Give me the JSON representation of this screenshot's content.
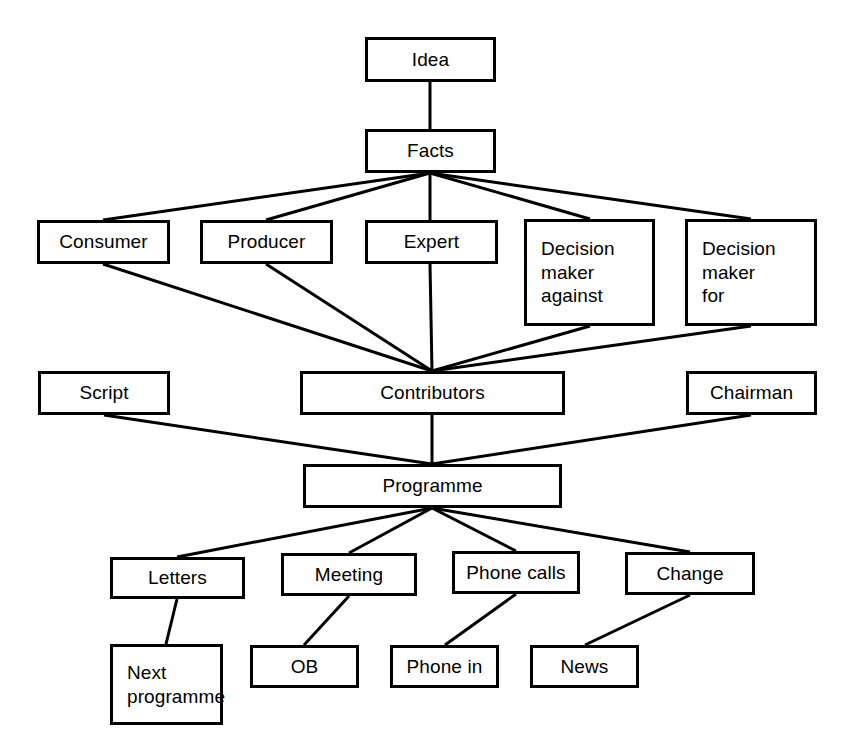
{
  "diagram": {
    "type": "flow-tree",
    "stroke_color": "#000000",
    "fill_color": "#ffffff",
    "background_color": "#ffffff",
    "stroke_width": 3,
    "nodes": [
      {
        "id": "idea",
        "label": "Idea",
        "x": 365,
        "y": 37,
        "w": 131,
        "h": 45,
        "align": "center"
      },
      {
        "id": "facts",
        "label": "Facts",
        "x": 365,
        "y": 129,
        "w": 131,
        "h": 44,
        "align": "center"
      },
      {
        "id": "consumer",
        "label": "Consumer",
        "x": 37,
        "y": 220,
        "w": 133,
        "h": 44,
        "align": "center"
      },
      {
        "id": "producer",
        "label": "Producer",
        "x": 200,
        "y": 220,
        "w": 133,
        "h": 44,
        "align": "center"
      },
      {
        "id": "expert",
        "label": "Expert",
        "x": 365,
        "y": 220,
        "w": 133,
        "h": 44,
        "align": "center"
      },
      {
        "id": "decision-against",
        "label": "Decision\nmaker\nagainst",
        "x": 524,
        "y": 219,
        "w": 131,
        "h": 107,
        "align": "left"
      },
      {
        "id": "decision-for",
        "label": "Decision\nmaker\nfor",
        "x": 685,
        "y": 219,
        "w": 132,
        "h": 107,
        "align": "left"
      },
      {
        "id": "script",
        "label": "Script",
        "x": 38,
        "y": 371,
        "w": 132,
        "h": 44,
        "align": "center"
      },
      {
        "id": "contributors",
        "label": "Contributors",
        "x": 300,
        "y": 371,
        "w": 265,
        "h": 44,
        "align": "center"
      },
      {
        "id": "chairman",
        "label": "Chairman",
        "x": 686,
        "y": 371,
        "w": 131,
        "h": 44,
        "align": "center"
      },
      {
        "id": "programme",
        "label": "Programme",
        "x": 303,
        "y": 464,
        "w": 259,
        "h": 44,
        "align": "center"
      },
      {
        "id": "letters",
        "label": "Letters",
        "x": 110,
        "y": 557,
        "w": 135,
        "h": 42,
        "align": "center"
      },
      {
        "id": "meeting",
        "label": "Meeting",
        "x": 281,
        "y": 553,
        "w": 136,
        "h": 43,
        "align": "center"
      },
      {
        "id": "phone-calls",
        "label": "Phone calls",
        "x": 452,
        "y": 551,
        "w": 128,
        "h": 43,
        "align": "center"
      },
      {
        "id": "change",
        "label": "Change",
        "x": 625,
        "y": 552,
        "w": 130,
        "h": 43,
        "align": "center"
      },
      {
        "id": "next-programme",
        "label": "Next\nprogramme",
        "x": 110,
        "y": 644,
        "w": 113,
        "h": 81,
        "align": "left"
      },
      {
        "id": "ob",
        "label": "OB",
        "x": 250,
        "y": 645,
        "w": 109,
        "h": 43,
        "align": "center"
      },
      {
        "id": "phone-in",
        "label": "Phone in",
        "x": 390,
        "y": 645,
        "w": 109,
        "h": 43,
        "align": "center"
      },
      {
        "id": "news",
        "label": "News",
        "x": 530,
        "y": 645,
        "w": 109,
        "h": 43,
        "align": "center"
      }
    ],
    "edges": [
      {
        "from": "idea",
        "to": "facts",
        "x1": 430,
        "y1": 82,
        "x2": 430,
        "y2": 129
      },
      {
        "from": "facts",
        "to": "consumer",
        "x1": 430,
        "y1": 173,
        "x2": 103,
        "y2": 220
      },
      {
        "from": "facts",
        "to": "producer",
        "x1": 430,
        "y1": 173,
        "x2": 266,
        "y2": 220
      },
      {
        "from": "facts",
        "to": "expert",
        "x1": 430,
        "y1": 173,
        "x2": 430,
        "y2": 220
      },
      {
        "from": "facts",
        "to": "decision-against",
        "x1": 430,
        "y1": 173,
        "x2": 590,
        "y2": 219
      },
      {
        "from": "facts",
        "to": "decision-for",
        "x1": 430,
        "y1": 173,
        "x2": 751,
        "y2": 219
      },
      {
        "from": "consumer",
        "to": "contributors",
        "x1": 103,
        "y1": 264,
        "x2": 432,
        "y2": 371
      },
      {
        "from": "producer",
        "to": "contributors",
        "x1": 266,
        "y1": 264,
        "x2": 432,
        "y2": 371
      },
      {
        "from": "expert",
        "to": "contributors",
        "x1": 430,
        "y1": 264,
        "x2": 432,
        "y2": 371
      },
      {
        "from": "decision-against",
        "to": "contributors",
        "x1": 590,
        "y1": 326,
        "x2": 432,
        "y2": 371
      },
      {
        "from": "decision-for",
        "to": "contributors",
        "x1": 751,
        "y1": 326,
        "x2": 432,
        "y2": 371
      },
      {
        "from": "script",
        "to": "programme",
        "x1": 104,
        "y1": 415,
        "x2": 432,
        "y2": 464
      },
      {
        "from": "contributors",
        "to": "programme",
        "x1": 432,
        "y1": 415,
        "x2": 432,
        "y2": 464
      },
      {
        "from": "chairman",
        "to": "programme",
        "x1": 751,
        "y1": 415,
        "x2": 432,
        "y2": 464
      },
      {
        "from": "programme",
        "to": "letters",
        "x1": 432,
        "y1": 508,
        "x2": 177,
        "y2": 557
      },
      {
        "from": "programme",
        "to": "meeting",
        "x1": 432,
        "y1": 508,
        "x2": 349,
        "y2": 553
      },
      {
        "from": "programme",
        "to": "phone-calls",
        "x1": 432,
        "y1": 508,
        "x2": 516,
        "y2": 551
      },
      {
        "from": "programme",
        "to": "change",
        "x1": 432,
        "y1": 508,
        "x2": 690,
        "y2": 552
      },
      {
        "from": "letters",
        "to": "next-programme",
        "x1": 177,
        "y1": 599,
        "x2": 166,
        "y2": 644
      },
      {
        "from": "meeting",
        "to": "ob",
        "x1": 349,
        "y1": 596,
        "x2": 304,
        "y2": 645
      },
      {
        "from": "phone-calls",
        "to": "phone-in",
        "x1": 516,
        "y1": 594,
        "x2": 445,
        "y2": 645
      },
      {
        "from": "change",
        "to": "news",
        "x1": 690,
        "y1": 595,
        "x2": 585,
        "y2": 645
      }
    ]
  }
}
